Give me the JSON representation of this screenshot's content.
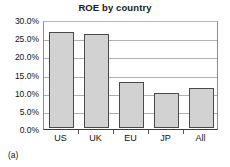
{
  "figure": {
    "caption": "(a)"
  },
  "chart_data": {
    "type": "bar",
    "title": "ROE by country",
    "xlabel": "",
    "ylabel": "",
    "categories": [
      "US",
      "UK",
      "EU",
      "JP",
      "All"
    ],
    "values": [
      0.264,
      0.258,
      0.127,
      0.095,
      0.109
    ],
    "value_labels": [
      "26.4%",
      "25.8%",
      "12.7%",
      "9.5%",
      "10.9%"
    ],
    "ylim": [
      0.0,
      0.3
    ],
    "ytick_values": [
      0.3,
      0.25,
      0.2,
      0.15,
      0.1,
      0.05,
      0.0
    ],
    "ytick_labels": [
      "30.0%",
      "25.0%",
      "20.0%",
      "15.0%",
      "10.0%",
      "5.0%",
      "0.0%"
    ],
    "grid": true,
    "legend": false,
    "bar_fill_color": "#d2d2d2",
    "bar_border_color": "#4a4a4a",
    "gridline_color": "#b0b0b0",
    "plot_background": "#ffffff"
  }
}
